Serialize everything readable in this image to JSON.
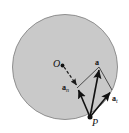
{
  "figure": {
    "background_color": "#ffffff",
    "disk": {
      "name": "rotating-disk",
      "fill_color": "#c9c9c9",
      "stroke_color": "#8a8a8a",
      "center_x": 65,
      "center_y": 67,
      "radius": 53
    },
    "points": [
      {
        "id": "center",
        "label": "O",
        "x": 62,
        "y": 65,
        "dot_radius": 1.8,
        "label_offset_x": -9,
        "label_offset_y": -6
      },
      {
        "id": "rim-point",
        "label": "P",
        "x": 90,
        "y": 117,
        "dot_radius": 2.4,
        "label_offset_x": 2,
        "label_offset_y": 1
      }
    ],
    "vectors": [
      {
        "id": "total-acceleration",
        "label": "a",
        "subscript": "",
        "from_x": 90,
        "from_y": 117,
        "to_x": 99,
        "to_y": 67,
        "color": "#111111",
        "width": 1.5,
        "style": "solid"
      },
      {
        "id": "normal-acceleration",
        "label": "a",
        "subscript": "n",
        "from_x": 90,
        "from_y": 117,
        "to_x": 77,
        "to_y": 88,
        "color": "#111111",
        "width": 1.5,
        "style": "solid"
      },
      {
        "id": "tangential-acceleration",
        "label": "a",
        "subscript": "t",
        "from_x": 90,
        "from_y": 117,
        "to_x": 112,
        "to_y": 90,
        "color": "#111111",
        "width": 1.5,
        "style": "solid"
      }
    ],
    "construction_lines": [
      {
        "id": "parallelogram-side-normal-to-total",
        "from_x": 77,
        "from_y": 88,
        "to_x": 99,
        "to_y": 67,
        "style": "solid",
        "color": "#3c3c3c",
        "width": 0.9
      },
      {
        "id": "parallelogram-side-tangential-to-total",
        "from_x": 112,
        "from_y": 90,
        "to_x": 99,
        "to_y": 67,
        "style": "solid",
        "color": "#3c3c3c",
        "width": 0.9
      },
      {
        "id": "radius-dashed-center-to-normal-tip",
        "from_x": 63,
        "from_y": 66,
        "to_x": 78,
        "to_y": 87,
        "style": "dashed",
        "color": "#1a1a1a",
        "width": 1.2,
        "dash_pattern": "3,2"
      }
    ]
  }
}
